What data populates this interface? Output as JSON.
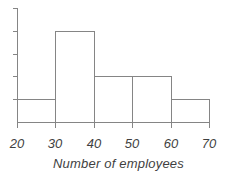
{
  "chart_data": {
    "type": "bar",
    "subtype": "histogram",
    "title": "",
    "xlabel": "Number of employees",
    "ylabel": "",
    "bin_edges": [
      20,
      30,
      40,
      50,
      60,
      70
    ],
    "categories": [
      "20-30",
      "30-40",
      "40-50",
      "50-60",
      "60-70"
    ],
    "values": [
      1,
      4,
      2,
      2,
      1
    ],
    "x_tick_labels": [
      "20",
      "30",
      "40",
      "50",
      "60",
      "70"
    ],
    "y_axis": {
      "labeled": false,
      "tick_count": 5,
      "range": [
        0,
        5
      ],
      "grid": false
    },
    "legend": null,
    "colors": {
      "line": "#858585",
      "text": "#3f3f3f",
      "bar_fill": "#ffffff"
    }
  }
}
